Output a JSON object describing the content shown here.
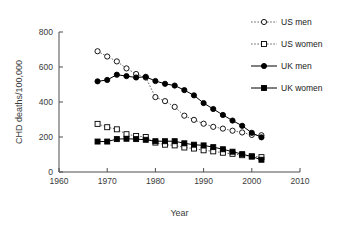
{
  "chart_data": {
    "type": "line",
    "title": "",
    "xlabel": "Year",
    "ylabel": "CHD deaths/100,000",
    "xlim": [
      1960,
      2010
    ],
    "ylim": [
      0,
      800
    ],
    "xticks": [
      1960,
      1970,
      1980,
      1990,
      2000,
      2010
    ],
    "yticks": [
      0,
      200,
      400,
      600,
      800
    ],
    "grid": false,
    "legend_position": "right",
    "x": [
      1968,
      1970,
      1972,
      1974,
      1976,
      1978,
      1980,
      1982,
      1984,
      1986,
      1988,
      1990,
      1992,
      1994,
      1996,
      1998,
      2000,
      2002
    ],
    "series": [
      {
        "name": "US men",
        "marker": "open-circle",
        "line": "dotted",
        "color": "#000000",
        "values": [
          690,
          660,
          632,
          592,
          560,
          540,
          428,
          405,
          372,
          322,
          298,
          276,
          258,
          248,
          236,
          226,
          212,
          210
        ]
      },
      {
        "name": "US women",
        "marker": "open-square",
        "line": "dotted",
        "color": "#000000",
        "values": [
          275,
          256,
          244,
          216,
          206,
          200,
          168,
          156,
          152,
          140,
          134,
          124,
          118,
          110,
          104,
          96,
          90,
          85
        ]
      },
      {
        "name": "UK men",
        "marker": "filled-circle",
        "line": "solid",
        "color": "#000000",
        "values": [
          518,
          526,
          556,
          548,
          540,
          544,
          520,
          504,
          494,
          468,
          438,
          394,
          360,
          326,
          294,
          264,
          224,
          198
        ]
      },
      {
        "name": "UK women",
        "marker": "filled-square",
        "line": "solid",
        "color": "#000000",
        "values": [
          174,
          174,
          188,
          190,
          188,
          184,
          176,
          176,
          176,
          164,
          156,
          152,
          142,
          130,
          116,
          102,
          88,
          70
        ]
      }
    ]
  },
  "legend": {
    "items": [
      {
        "label": "US men",
        "marker": "open-circle",
        "line": "dotted"
      },
      {
        "label": "US women",
        "marker": "open-square",
        "line": "dotted"
      },
      {
        "label": "UK men",
        "marker": "filled-circle",
        "line": "solid"
      },
      {
        "label": "UK women",
        "marker": "filled-square",
        "line": "solid"
      }
    ]
  }
}
